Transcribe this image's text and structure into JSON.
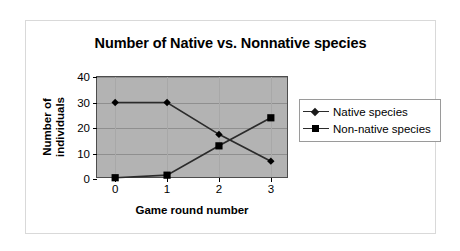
{
  "chart_data": {
    "type": "line",
    "title": "Number of Native vs. Nonnative species",
    "xlabel": "Game round number",
    "ylabel": "Number of individuals",
    "ylabel_lines": [
      "Number of",
      "individuals"
    ],
    "categories": [
      "0",
      "1",
      "2",
      "3"
    ],
    "x": [
      0,
      1,
      2,
      3
    ],
    "series": [
      {
        "name": "Native species",
        "marker": "diamond",
        "values": [
          30,
          30,
          17.5,
          7
        ]
      },
      {
        "name": "Non-native species",
        "marker": "square",
        "values": [
          0.5,
          1.5,
          13,
          24
        ]
      }
    ],
    "ylim": [
      0,
      40
    ],
    "yticks": [
      0,
      10,
      20,
      30,
      40
    ],
    "ytick_labels": [
      "0",
      "10",
      "20",
      "30",
      "40"
    ],
    "xlim": [
      -0.35,
      3.35
    ],
    "xticks": [
      0,
      1,
      2,
      3
    ],
    "xtick_labels": [
      "0",
      "1",
      "2",
      "3"
    ],
    "grid": "horizontal",
    "legend_position": "right",
    "plot_background": "#b3b3b3",
    "page_background": "#ffffff",
    "line_color": "#2b2b2b",
    "marker_color": "#000000"
  },
  "legend": {
    "entries": [
      {
        "label": "Native species",
        "marker": "diamond-marker"
      },
      {
        "label": "Non-native species",
        "marker": "square-marker"
      }
    ]
  }
}
